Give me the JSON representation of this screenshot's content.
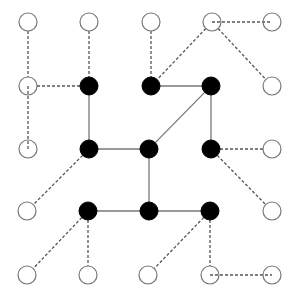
{
  "diagram": {
    "type": "graph",
    "width": 298,
    "height": 301,
    "node_radius": 9,
    "colors": {
      "background": "#ffffff",
      "filled_node": "#000000",
      "open_node_fill": "#ffffff",
      "open_node_stroke": "#777777",
      "solid_edge": "#777777",
      "dashed_edge": "#555555"
    },
    "nodes": [
      {
        "id": "r1c1",
        "x": 28,
        "y": 22,
        "filled": false
      },
      {
        "id": "r1c2",
        "x": 89,
        "y": 22,
        "filled": false
      },
      {
        "id": "r1c3",
        "x": 151,
        "y": 22,
        "filled": false
      },
      {
        "id": "r1c4",
        "x": 212,
        "y": 22,
        "filled": false
      },
      {
        "id": "r1c5",
        "x": 272,
        "y": 22,
        "filled": false
      },
      {
        "id": "r2c1",
        "x": 28,
        "y": 86,
        "filled": false
      },
      {
        "id": "r2c2",
        "x": 89,
        "y": 86,
        "filled": true
      },
      {
        "id": "r2c3",
        "x": 151,
        "y": 86,
        "filled": true
      },
      {
        "id": "r2c4",
        "x": 211,
        "y": 86,
        "filled": true
      },
      {
        "id": "r2c5",
        "x": 272,
        "y": 86,
        "filled": false
      },
      {
        "id": "r3c1",
        "x": 28,
        "y": 149,
        "filled": false
      },
      {
        "id": "r3c2",
        "x": 89,
        "y": 149,
        "filled": true
      },
      {
        "id": "r3c3",
        "x": 149,
        "y": 149,
        "filled": true
      },
      {
        "id": "r3c4",
        "x": 211,
        "y": 149,
        "filled": true
      },
      {
        "id": "r3c5",
        "x": 272,
        "y": 149,
        "filled": false
      },
      {
        "id": "r4c1",
        "x": 27,
        "y": 211,
        "filled": false
      },
      {
        "id": "r4c2",
        "x": 88,
        "y": 211,
        "filled": true
      },
      {
        "id": "r4c3",
        "x": 149,
        "y": 211,
        "filled": true
      },
      {
        "id": "r4c4",
        "x": 210,
        "y": 211,
        "filled": true
      },
      {
        "id": "r4c5",
        "x": 272,
        "y": 211,
        "filled": false
      },
      {
        "id": "r5c1",
        "x": 27,
        "y": 275,
        "filled": false
      },
      {
        "id": "r5c2",
        "x": 88,
        "y": 275,
        "filled": false
      },
      {
        "id": "r5c3",
        "x": 148,
        "y": 275,
        "filled": false
      },
      {
        "id": "r5c4",
        "x": 210,
        "y": 275,
        "filled": false
      },
      {
        "id": "r5c5",
        "x": 272,
        "y": 275,
        "filled": false
      }
    ],
    "edges": [
      {
        "from": "r2c2",
        "to": "r3c2",
        "style": "solid"
      },
      {
        "from": "r2c3",
        "to": "r2c4",
        "style": "solid"
      },
      {
        "from": "r2c4",
        "to": "r3c3",
        "style": "solid"
      },
      {
        "from": "r2c4",
        "to": "r3c4",
        "style": "solid"
      },
      {
        "from": "r3c2",
        "to": "r3c3",
        "style": "solid"
      },
      {
        "from": "r3c3",
        "to": "r4c3",
        "style": "solid"
      },
      {
        "from": "r4c2",
        "to": "r4c3",
        "style": "solid"
      },
      {
        "from": "r4c3",
        "to": "r4c4",
        "style": "solid"
      },
      {
        "from": "r1c1",
        "to": "r2c1",
        "style": "dashed"
      },
      {
        "from": "r2c1",
        "to": "r3c1",
        "style": "dashed",
        "center_to_center": true
      },
      {
        "from": "r2c1",
        "to": "r2c2",
        "style": "dashed"
      },
      {
        "from": "r1c2",
        "to": "r2c2",
        "style": "dashed"
      },
      {
        "from": "r1c3",
        "to": "r2c3",
        "style": "dashed"
      },
      {
        "from": "r1c4",
        "to": "r2c3",
        "style": "dashed"
      },
      {
        "from": "r1c4",
        "to": "r1c5",
        "style": "dashed",
        "center_to_center": true
      },
      {
        "from": "r1c4",
        "to": "r2c5",
        "style": "dashed"
      },
      {
        "from": "r3c2",
        "to": "r4c1",
        "style": "dashed"
      },
      {
        "from": "r3c4",
        "to": "r3c5",
        "style": "dashed"
      },
      {
        "from": "r3c4",
        "to": "r4c5",
        "style": "dashed"
      },
      {
        "from": "r4c2",
        "to": "r5c1",
        "style": "dashed"
      },
      {
        "from": "r4c2",
        "to": "r5c2",
        "style": "dashed"
      },
      {
        "from": "r4c4",
        "to": "r5c3",
        "style": "dashed"
      },
      {
        "from": "r4c4",
        "to": "r5c4",
        "style": "dashed"
      },
      {
        "from": "r5c4",
        "to": "r5c5",
        "style": "dashed",
        "center_to_center": true
      }
    ]
  }
}
